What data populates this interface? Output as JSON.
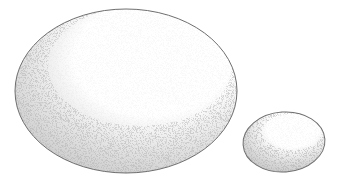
{
  "illustration": {
    "title": "Two eggs (stipple drawing)",
    "background": "#ffffff",
    "outline_color": "#6e6e6e",
    "stipple_color": "#9a9a9a",
    "objects": [
      {
        "name": "large-egg",
        "cx": 126,
        "cy": 91,
        "rx": 111,
        "ry": 82,
        "rotation": 0
      },
      {
        "name": "small-egg",
        "cx": 284,
        "cy": 142,
        "rx": 41,
        "ry": 30,
        "rotation": -4
      }
    ]
  }
}
